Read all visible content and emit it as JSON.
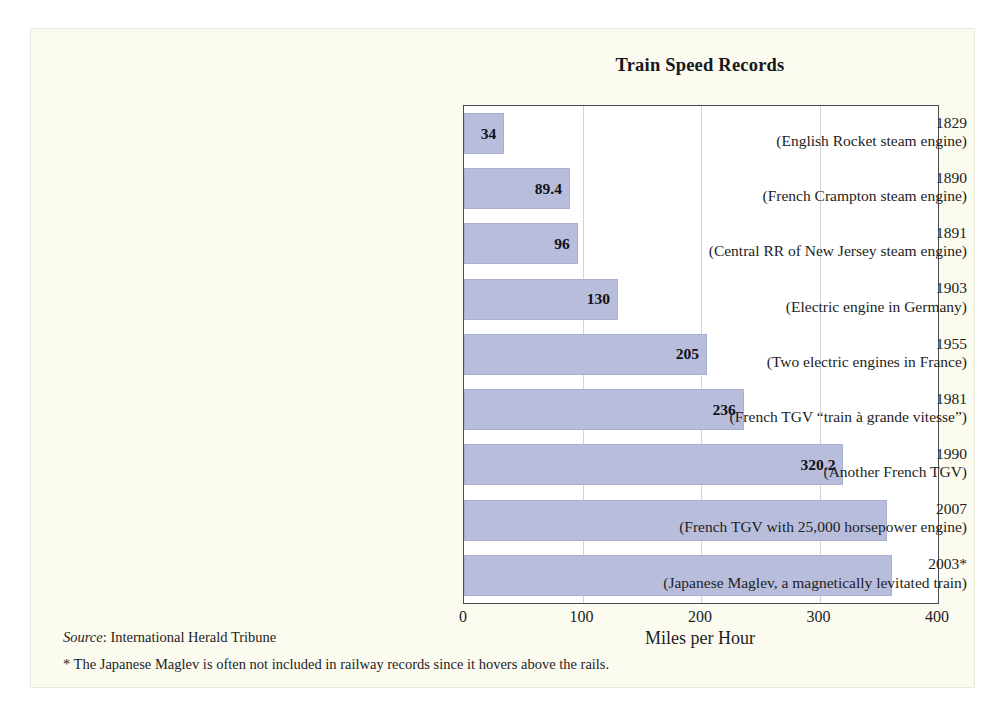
{
  "chart_data": {
    "type": "bar",
    "orientation": "horizontal",
    "title": "Train Speed Records",
    "xlabel": "Miles per Hour",
    "ylabel": "",
    "xlim": [
      0,
      400
    ],
    "xticks": [
      "0",
      "100",
      "200",
      "300",
      "400"
    ],
    "grid": "vertical gridlines at 100, 200, 300",
    "legend": "none",
    "bar_color": "#b9bddc",
    "categories": [
      "1829 (English Rocket steam engine)",
      "1890 (French Crampton steam engine)",
      "1891 (Central RR of New Jersey steam engine)",
      "1903 (Electric engine in Germany)",
      "1955 (Two electric engines in France)",
      "1981 (French TGV “train à grande vitesse”)",
      "1990 (Another French TGV)",
      "2007 (French TGV with 25,000 horsepower engine)",
      "2003* (Japanese Maglev, a magnetically levitated train)"
    ],
    "values": [
      34,
      89.4,
      96,
      130,
      205,
      236,
      320.2,
      357,
      361
    ],
    "bars": [
      {
        "year": "1829",
        "desc": "(English Rocket steam engine)",
        "value": 34,
        "label": "34"
      },
      {
        "year": "1890",
        "desc": "(French Crampton steam engine)",
        "value": 89.4,
        "label": "89.4"
      },
      {
        "year": "1891",
        "desc": "(Central RR of New Jersey steam engine)",
        "value": 96,
        "label": "96"
      },
      {
        "year": "1903",
        "desc": "(Electric engine in Germany)",
        "value": 130,
        "label": "130"
      },
      {
        "year": "1955",
        "desc": "(Two electric engines in France)",
        "value": 205,
        "label": "205"
      },
      {
        "year": "1981",
        "desc": "(French TGV “train à grande vitesse”)",
        "value": 236,
        "label": "236"
      },
      {
        "year": "1990",
        "desc": "(Another French TGV)",
        "value": 320.2,
        "label": "320.2"
      },
      {
        "year": "2007",
        "desc": "(French TGV with 25,000 horsepower engine)",
        "value": 357,
        "label": ""
      },
      {
        "year": "2003*",
        "desc": "(Japanese Maglev, a magnetically levitated train)",
        "value": 361,
        "label": ""
      }
    ]
  },
  "footer": {
    "source_label": "Source",
    "source_separator": ": ",
    "source_value": "International Herald Tribune",
    "footnote": "* The Japanese Maglev is often not included in railway records since it hovers above the rails."
  }
}
